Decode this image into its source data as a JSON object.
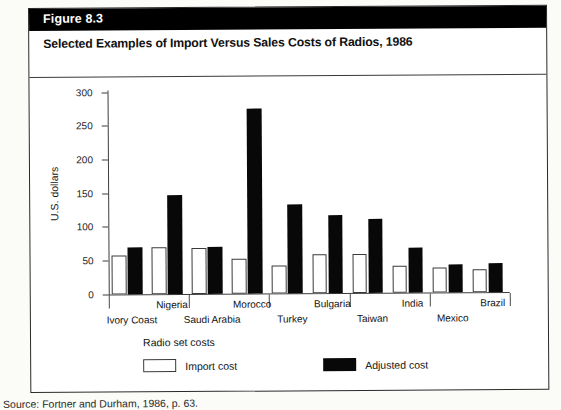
{
  "figure": {
    "number_label": "Figure 8.3",
    "title": "Selected Examples of Import Versus Sales Costs of Radios, 1986",
    "source": "Source: Fortner and Durham, 1986, p. 63."
  },
  "legend": {
    "title": "Radio set costs",
    "import_label": "Import cost",
    "adjusted_label": "Adjusted cost",
    "import_color": "#ffffff",
    "adjusted_color": "#080808"
  },
  "chart_data": {
    "type": "bar",
    "title": "Selected Examples of Import Versus Sales Costs of Radios, 1986",
    "xlabel": "",
    "ylabel": "U.S. dollars",
    "ylim": [
      0,
      300
    ],
    "yticks": [
      0,
      50,
      100,
      150,
      200,
      250,
      300
    ],
    "grid": false,
    "legend_position": "below-left",
    "categories": [
      "Ivory Coast",
      "Nigeria",
      "Saudi Arabia",
      "Morocco",
      "Turkey",
      "Bulgaria",
      "Taiwan",
      "India",
      "Mexico",
      "Brazil"
    ],
    "series": [
      {
        "name": "Import cost",
        "color": "#ffffff",
        "values": [
          57,
          70,
          68,
          51,
          41,
          57,
          57,
          40,
          37,
          34
        ]
      },
      {
        "name": "Adjusted cost",
        "color": "#080808",
        "values": [
          70,
          147,
          70,
          274,
          132,
          116,
          110,
          67,
          41,
          42
        ]
      }
    ]
  }
}
